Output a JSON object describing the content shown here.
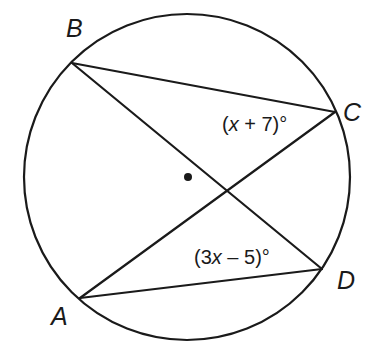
{
  "diagram": {
    "circle": {
      "cx": 187,
      "cy": 177,
      "r": 163,
      "center_dot": {
        "x": 188,
        "y": 177,
        "r": 4
      }
    },
    "points": {
      "A": {
        "label": "A",
        "x": 80,
        "y": 298
      },
      "B": {
        "label": "B",
        "x": 72,
        "y": 63
      },
      "C": {
        "label": "C",
        "x": 335,
        "y": 112
      },
      "D": {
        "label": "D",
        "x": 322,
        "y": 269
      }
    },
    "segments": [
      "BC",
      "BD",
      "AC",
      "AD"
    ],
    "angles": {
      "C": {
        "prefix": "(",
        "var": "x",
        "suffix": " + 7)°",
        "text": "(x + 7)°"
      },
      "D": {
        "prefix": "(3",
        "var": "x",
        "suffix": " – 5)°",
        "text": "(3x – 5)°"
      }
    },
    "colors": {
      "stroke": "#1a1a1a",
      "background": "#ffffff"
    }
  }
}
